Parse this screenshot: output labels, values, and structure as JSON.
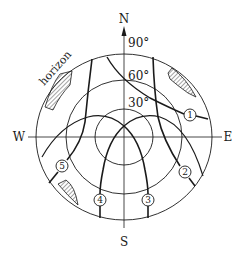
{
  "diagram": {
    "compass": {
      "north": "N",
      "south": "S",
      "east": "E",
      "west": "W"
    },
    "altitude_labels": {
      "a90": "90°",
      "a60": "60°",
      "a30": "30°"
    },
    "horizon_label": "horizon",
    "paths": [
      {
        "id": "path-1",
        "label": "1"
      },
      {
        "id": "path-2",
        "label": "2"
      },
      {
        "id": "path-3",
        "label": "3"
      },
      {
        "id": "path-4",
        "label": "4"
      },
      {
        "id": "path-5",
        "label": "5"
      }
    ],
    "shaded_regions": [
      "north-west obstruction",
      "north-east obstruction",
      "south-west obstruction"
    ],
    "colors": {
      "line": "#1a1a1a",
      "background": "#ffffff"
    }
  }
}
